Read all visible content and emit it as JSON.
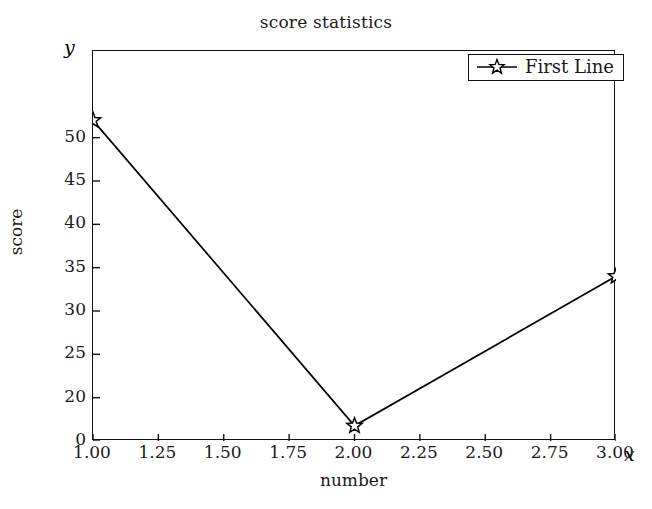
{
  "chart_data": {
    "type": "line",
    "title": "score statistics",
    "xlabel": "number",
    "ylabel": "score",
    "x_axis_symbol": "x",
    "y_axis_symbol": "y",
    "grid": false,
    "legend_position": "upper right",
    "x": [
      1.0,
      2.0,
      3.0
    ],
    "xlim": [
      1.0,
      3.0
    ],
    "ylim": [
      0,
      53
    ],
    "xticks": [
      1.0,
      1.25,
      1.5,
      1.75,
      2.0,
      2.25,
      2.5,
      2.75,
      3.0
    ],
    "xtick_labels": [
      "1.00",
      "1.25",
      "1.50",
      "1.75",
      "2.00",
      "2.25",
      "2.50",
      "2.75",
      "3.00"
    ],
    "yticks": [
      0,
      20,
      25,
      30,
      35,
      40,
      45,
      50
    ],
    "ytick_labels": [
      "0",
      "20",
      "25",
      "30",
      "35",
      "40",
      "45",
      "50"
    ],
    "y_axis_broken": true,
    "series": [
      {
        "name": "First Line",
        "marker": "star",
        "color": "#000000",
        "values": [
          52,
          7,
          34
        ]
      }
    ]
  },
  "legend": {
    "entries": [
      {
        "label": "First Line",
        "marker": "star-marker-icon"
      }
    ]
  }
}
